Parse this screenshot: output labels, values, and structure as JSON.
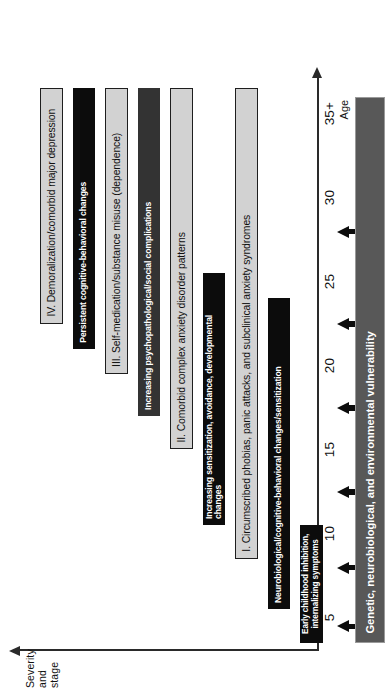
{
  "figure": {
    "type": "staged-timeline-diagram"
  },
  "axes": {
    "y": {
      "label": "Severity\nand\nstage",
      "arrow_direction": "up"
    },
    "x": {
      "title": "Age",
      "ticks": [
        "5",
        "10",
        "15",
        "20",
        "25",
        "30",
        "35+"
      ],
      "arrow_direction": "right"
    }
  },
  "colors": {
    "stage_bar_fill": "#d2d2d2",
    "stage_bar_border": "#1e1e1e",
    "process_bar_black": "#0c0c0c",
    "process_bar_dark": "#333333",
    "foundation_bar": "#585858",
    "text_dark": "#101010",
    "text_light": "#ffffff"
  },
  "chart_data": {
    "type": "bar",
    "xlabel": "Age",
    "ylabel": "Severity and stage",
    "xlim": [
      3,
      37
    ],
    "grid": false,
    "legend": "none",
    "bars": [
      {
        "id": "stage-4",
        "kind": "stage",
        "label": "IV. Demoralization/comorbid major depression",
        "start_age": 22.5,
        "end_age": 36.5,
        "style": "roman"
      },
      {
        "id": "process-persistent-cognitive",
        "kind": "process",
        "label": "Persistent cognitive-behavioral changes",
        "start_age": 21.0,
        "end_age": 36.5,
        "style": "process-black"
      },
      {
        "id": "stage-3",
        "kind": "stage",
        "label": "III. Self-medication/substance misuse (dependence)",
        "start_age": 19.5,
        "end_age": 36.5,
        "style": "roman"
      },
      {
        "id": "process-increasing-psychopathological",
        "kind": "process",
        "label": "Increasing psychopathological/social complications",
        "start_age": 17.0,
        "end_age": 36.5,
        "style": "process-dark"
      },
      {
        "id": "stage-2",
        "kind": "stage",
        "label": "II. Comorbid complex anxiety disorder patterns",
        "start_age": 15.0,
        "end_age": 36.5,
        "style": "roman"
      },
      {
        "id": "process-increasing-sensitization",
        "kind": "process",
        "label": "Increasing sensitization, avoidance, developmental changes",
        "start_age": 10.5,
        "end_age": 25.5,
        "style": "process-black"
      },
      {
        "id": "stage-1",
        "kind": "stage",
        "label": "I. Circumscribed phobias, panic attacks, and subclinical anxiety syndromes",
        "start_age": 8.5,
        "end_age": 36.5,
        "style": "roman"
      },
      {
        "id": "process-neurobiological",
        "kind": "process",
        "label": "Neurobiological/cognitive-behavioral changes/sensitization",
        "start_age": 5.5,
        "end_age": 24.0,
        "style": "process-black"
      },
      {
        "id": "process-early-childhood",
        "kind": "process",
        "label": "Early childhood inhibition,\ninternalizing symptoms",
        "start_age": 3.5,
        "end_age": 10.5,
        "style": "process-black"
      }
    ],
    "foundation": {
      "id": "foundation-vulnerability",
      "label": "Genetic, neurobiological, and environmental vulnerability",
      "start_age": 3.5,
      "end_age": 36.0
    },
    "vulnerability_arrows": {
      "count": 6,
      "ages": [
        4.5,
        8.0,
        12.5,
        17.5,
        22.5,
        28.0
      ],
      "direction": "up"
    }
  }
}
